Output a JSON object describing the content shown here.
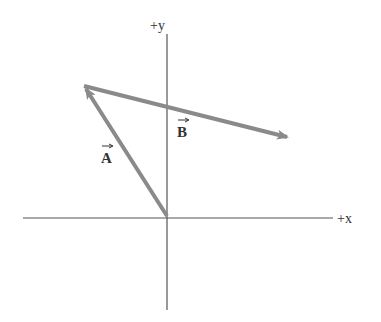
{
  "diagram": {
    "axes": {
      "x_label": "+x",
      "y_label": "+y",
      "origin": [
        167,
        218
      ],
      "x_range": [
        23,
        333
      ],
      "y_range": [
        34,
        310
      ],
      "color": "#555555"
    },
    "vectors": [
      {
        "name": "A",
        "label": "A",
        "from": [
          167,
          216
        ],
        "to": [
          84,
          86
        ],
        "color": "#8a8a8a"
      },
      {
        "name": "B",
        "label": "B",
        "from": [
          84,
          86
        ],
        "to": [
          289,
          138
        ],
        "color": "#8a8a8a"
      }
    ]
  }
}
